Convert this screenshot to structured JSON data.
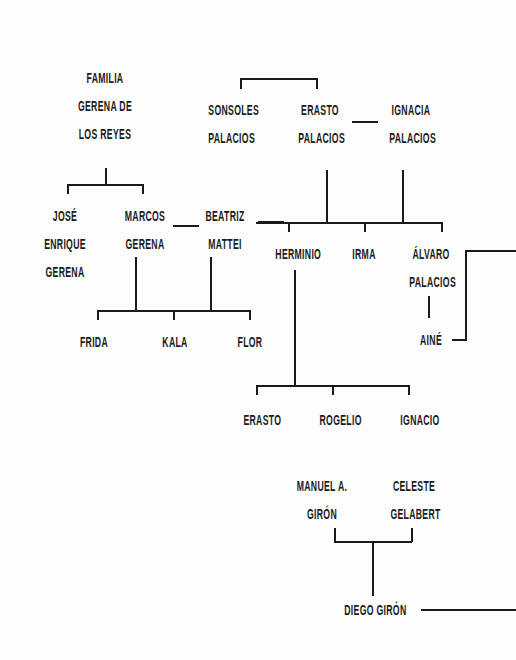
{
  "diagram": {
    "type": "family-tree",
    "line_color": "#1a1a1a",
    "background": "#fdfdfd"
  },
  "nodes": {
    "familia_title": {
      "lines": [
        "FAMILIA",
        "GERENA DE",
        "LOS REYES"
      ]
    },
    "sonsoles": {
      "lines": [
        "SONSOLES",
        "PALACIOS"
      ]
    },
    "erasto_palacios": {
      "lines": [
        "ERASTO",
        "PALACIOS"
      ]
    },
    "ignacia": {
      "lines": [
        "IGNACIA",
        "PALACIOS"
      ]
    },
    "jose_enrique": {
      "lines": [
        "JOSÉ",
        "ENRIQUE",
        "GERENA"
      ]
    },
    "marcos": {
      "lines": [
        "MARCOS",
        "GERENA"
      ]
    },
    "beatriz": {
      "lines": [
        "BEATRIZ",
        "MATTEI"
      ]
    },
    "herminio": {
      "lines": [
        "HERMINIO"
      ]
    },
    "irma": {
      "lines": [
        "IRMA"
      ]
    },
    "alvaro": {
      "lines": [
        "ÁLVARO",
        "PALACIOS"
      ]
    },
    "aine": {
      "lines": [
        "AINÉ"
      ]
    },
    "frida": {
      "lines": [
        "FRIDA"
      ]
    },
    "kala": {
      "lines": [
        "KALA"
      ]
    },
    "flor": {
      "lines": [
        "FLOR"
      ]
    },
    "erasto_jr": {
      "lines": [
        "ERASTO"
      ]
    },
    "rogelio": {
      "lines": [
        "ROGELIO"
      ]
    },
    "ignacio": {
      "lines": [
        "IGNACIO"
      ]
    },
    "manuel": {
      "lines": [
        "MANUEL A.",
        "GIRÓN"
      ]
    },
    "celeste": {
      "lines": [
        "CELESTE",
        "GELABERT"
      ]
    },
    "diego": {
      "lines": [
        "DIEGO GIRÓN"
      ]
    }
  }
}
